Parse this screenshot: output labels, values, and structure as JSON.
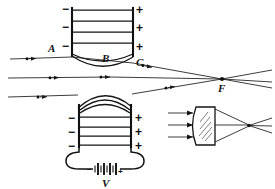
{
  "figure": {
    "background_color": "#ffffff",
    "ink_color": "#111111"
  },
  "labels": {
    "a": "A",
    "b": "B",
    "c": "C",
    "f": "F",
    "v": "V"
  },
  "signs": {
    "negative": "−",
    "positive": "+"
  },
  "upper_lens": {
    "name": "upper-electrostatic-lens",
    "negative_plate_signs": [
      "−",
      "−",
      "−"
    ],
    "positive_plate_signs": [
      "+",
      "+",
      "+"
    ],
    "equipotential_count": 4,
    "curved_equipotential_count": 2,
    "label_on_field_line": "B",
    "label_at_entrance": "A",
    "label_at_exit": "C"
  },
  "lower_lens": {
    "name": "lower-electrostatic-lens",
    "negative_plate_signs": [
      "−",
      "−",
      "−"
    ],
    "positive_plate_signs": [
      "+",
      "+",
      "+"
    ],
    "equipotential_count": 4,
    "curved_equipotential_count": 3
  },
  "battery": {
    "name": "battery-source",
    "label": "V",
    "negative_terminal": "−",
    "positive_terminal": "+",
    "cell_pairs": 5
  },
  "focus": {
    "label": "F",
    "marker": "focal-point-dot"
  },
  "electron_rays": {
    "name": "electron-beam-rays",
    "count": 4,
    "marker": "electron-arrow-marker",
    "description": "parallel electron beams converging to focus F"
  },
  "optical_lens": {
    "name": "glass-lens-analogy",
    "incoming_ray_count": 3,
    "shape": "converging-lens",
    "hatched": true
  }
}
